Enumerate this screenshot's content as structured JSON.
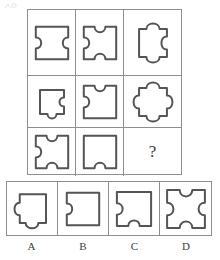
{
  "test": {
    "type": "matrix-reasoning",
    "subject": "jigsaw-puzzle-pieces",
    "question_mark": "?"
  },
  "corner_mark": {
    "name": "faint-artifact",
    "visible": true
  },
  "matrix": {
    "rows": 3,
    "columns": 3,
    "cells": [
      {
        "id": "cell-1-1",
        "position": "row1-col1",
        "description": "square with concave notch on left and concave notch on right",
        "edges": {
          "top": "flat",
          "right": "notch",
          "bottom": "flat",
          "left": "notch"
        },
        "feature_count": 2
      },
      {
        "id": "cell-1-2",
        "position": "row1-col2",
        "description": "square with concave notches on top, bottom and left",
        "edges": {
          "top": "notch",
          "right": "flat",
          "bottom": "notch",
          "left": "notch"
        },
        "feature_count": 3
      },
      {
        "id": "cell-1-3",
        "position": "row1-col3",
        "description": "square with convex tabs on top and bottom and concave notch on right",
        "edges": {
          "top": "tab",
          "right": "notch",
          "bottom": "tab",
          "left": "flat"
        },
        "feature_count": 3
      },
      {
        "id": "cell-2-1",
        "position": "row2-col1",
        "description": "square with concave notch on right and convex tab on bottom",
        "edges": {
          "top": "flat",
          "right": "notch",
          "bottom": "tab",
          "left": "flat"
        },
        "feature_count": 2
      },
      {
        "id": "cell-2-2",
        "position": "row2-col2",
        "description": "square with concave notches on top and left",
        "edges": {
          "top": "notch",
          "right": "flat",
          "bottom": "flat",
          "left": "notch"
        },
        "feature_count": 2
      },
      {
        "id": "cell-2-3",
        "position": "row2-col3",
        "description": "square with convex tabs on all four sides",
        "edges": {
          "top": "tab",
          "right": "tab",
          "bottom": "tab",
          "left": "tab"
        },
        "feature_count": 4
      },
      {
        "id": "cell-3-1",
        "position": "row3-col1",
        "description": "square with concave notches on top, bottom and left",
        "edges": {
          "top": "notch",
          "right": "flat",
          "bottom": "notch",
          "left": "notch"
        },
        "feature_count": 3
      },
      {
        "id": "cell-3-2",
        "position": "row3-col2",
        "description": "square with a single concave notch on the bottom",
        "edges": {
          "top": "flat",
          "right": "flat",
          "bottom": "notch",
          "left": "flat"
        },
        "feature_count": 1
      },
      {
        "id": "cell-3-3",
        "position": "row3-col3",
        "description": "missing cell marked with a question mark",
        "edges": null,
        "feature_count": null,
        "is_question": true
      }
    ]
  },
  "options": {
    "count": 4,
    "items": [
      {
        "id": "option-a",
        "label": "A",
        "description": "square with convex tab on left and convex tab on bottom",
        "edges": {
          "top": "flat",
          "right": "flat",
          "bottom": "tab",
          "left": "tab"
        },
        "feature_count": 2
      },
      {
        "id": "option-b",
        "label": "B",
        "description": "square with a single concave notch on the left",
        "edges": {
          "top": "flat",
          "right": "flat",
          "bottom": "flat",
          "left": "notch"
        },
        "feature_count": 1
      },
      {
        "id": "option-c",
        "label": "C",
        "description": "square with concave notch on left and concave notch on bottom",
        "edges": {
          "top": "flat",
          "right": "flat",
          "bottom": "notch",
          "left": "notch"
        },
        "feature_count": 2
      },
      {
        "id": "option-d",
        "label": "D",
        "description": "square with concave notches on all four sides",
        "edges": {
          "top": "notch",
          "right": "notch",
          "bottom": "notch",
          "left": "notch"
        },
        "feature_count": 4
      }
    ]
  },
  "colors": {
    "stroke": "#555555",
    "grid_line": "#8e8e8e",
    "background": "#ffffff",
    "text": "#3d3d3d"
  }
}
